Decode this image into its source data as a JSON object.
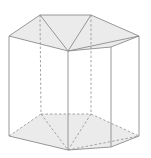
{
  "diagram": {
    "colors": {
      "background": "#ffffff",
      "face_fill": "#ebebeb",
      "edge": "#8c8c8c",
      "hidden_edge": "#9a9a9a"
    },
    "top_face": {
      "points": "9,36 40,15 91,15 139,36 111,47 68,51"
    },
    "bottom_face": {
      "points": "9,136 41,114 91,114 139,136 111,147 68,150"
    },
    "solid_edges": [
      [
        9,
        36,
        40,
        15
      ],
      [
        40,
        15,
        91,
        15
      ],
      [
        91,
        15,
        139,
        36
      ],
      [
        139,
        36,
        111,
        47
      ],
      [
        111,
        47,
        68,
        51
      ],
      [
        68,
        51,
        9,
        36
      ],
      [
        40,
        15,
        68,
        51
      ],
      [
        91,
        15,
        68,
        51
      ],
      [
        68,
        51,
        139,
        36
      ],
      [
        9,
        36,
        9,
        136
      ],
      [
        68,
        51,
        68,
        150
      ],
      [
        111,
        47,
        111,
        147
      ],
      [
        139,
        36,
        139,
        136
      ],
      [
        9,
        136,
        68,
        150
      ],
      [
        68,
        150,
        111,
        147
      ],
      [
        111,
        147,
        139,
        136
      ]
    ],
    "dashed_edges": [
      [
        40,
        15,
        41,
        114
      ],
      [
        91,
        15,
        91,
        114
      ],
      [
        9,
        136,
        41,
        114
      ],
      [
        41,
        114,
        91,
        114
      ],
      [
        91,
        114,
        139,
        136
      ],
      [
        41,
        114,
        68,
        150
      ],
      [
        91,
        114,
        68,
        150
      ],
      [
        68,
        150,
        139,
        136
      ]
    ]
  }
}
